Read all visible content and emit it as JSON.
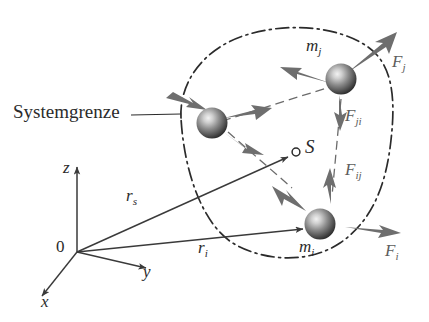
{
  "figure": {
    "kind": "mechanics-diagram",
    "language": "de",
    "background_color": "#ffffff",
    "ink_color": "#2b2b2b",
    "arrow_color": "#6e6e6e",
    "sphere_color": "#555555",
    "boundary_style": "dash-dot"
  },
  "annotations": {
    "system_boundary_label": "Systemgrenze",
    "origin_label": "0",
    "center_of_mass_label": "S"
  },
  "axes": [
    {
      "name": "z",
      "label": "z",
      "direction": "up"
    },
    {
      "name": "y",
      "label": "y",
      "direction": "right"
    },
    {
      "name": "x",
      "label": "x",
      "direction": "down-left"
    }
  ],
  "vectors": [
    {
      "name": "r_s",
      "base": "r",
      "sub": "s",
      "from": "0",
      "to": "S"
    },
    {
      "name": "r_i",
      "base": "r",
      "sub": "i",
      "from": "0",
      "to": "m_i"
    }
  ],
  "masses": [
    {
      "name": "m_j",
      "base": "m",
      "sub": "j"
    },
    {
      "name": "m_i",
      "base": "m",
      "sub": "i"
    }
  ],
  "forces": {
    "external": [
      {
        "name": "F_j",
        "base": "F",
        "sub": "j",
        "acts_on": "m_j",
        "direction": "up-right"
      },
      {
        "name": "F_i",
        "base": "F",
        "sub": "i",
        "acts_on": "m_i",
        "direction": "right"
      }
    ],
    "internal": [
      {
        "name": "F_ji",
        "base": "F",
        "sub": "ji",
        "acts_on": "m_j",
        "direction": "down"
      },
      {
        "name": "F_ij",
        "base": "F",
        "sub": "ij",
        "acts_on": "m_i",
        "direction": "up"
      }
    ]
  }
}
